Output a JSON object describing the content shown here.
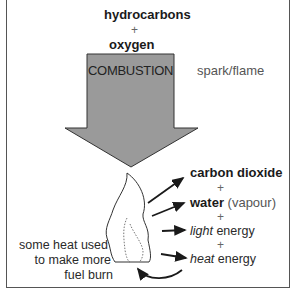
{
  "reactants": {
    "first": "hydrocarbons",
    "plus": "+",
    "second": "oxygen"
  },
  "process": {
    "label": "COMBUSTION",
    "condition": "spark/flame"
  },
  "products": [
    {
      "bold": "carbon dioxide",
      "rest": ""
    },
    {
      "bold": "water",
      "rest": " (vapour)"
    },
    {
      "italic": "light",
      "rest": " energy"
    },
    {
      "italic": "heat",
      "rest": " energy"
    }
  ],
  "product_plus": "+",
  "feedback_note": {
    "line1": "some heat used",
    "line2": "to make more",
    "line3": "fuel burn"
  },
  "colors": {
    "arrow_fill": "#9a9a9a",
    "arrow_stroke": "#333333",
    "border": "#555555"
  }
}
